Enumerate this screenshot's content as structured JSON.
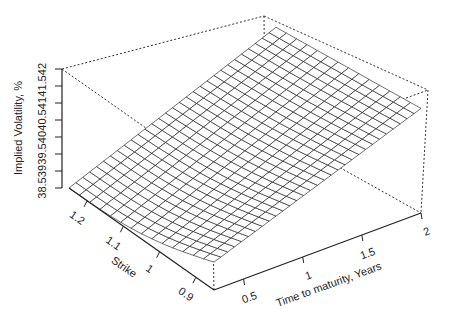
{
  "chart_data": {
    "type": "surface3d",
    "title": "",
    "xlabel": "Time to maturity, Years",
    "ylabel": "Strike",
    "zlabel": "Implied Volatility, %",
    "x_ticks": [
      "0.5",
      "1",
      "1.5",
      "2"
    ],
    "y_ticks": [
      "1.2",
      "1.1",
      "1",
      "0.9"
    ],
    "z_ticks": [
      "38.5",
      "39",
      "39.5",
      "40",
      "40.5",
      "41",
      "41.5",
      "42"
    ],
    "x_range": [
      0.25,
      2.0
    ],
    "y_range": [
      0.85,
      1.25
    ],
    "z_range": [
      38.5,
      42.0
    ],
    "grid": false,
    "legend": "none",
    "surface_style": "wireframe mesh, black",
    "surface_corners": [
      {
        "time": 0.25,
        "strike": 1.25,
        "vol": 38.5
      },
      {
        "time": 0.25,
        "strike": 0.85,
        "vol": 39.3
      },
      {
        "time": 2.0,
        "strike": 0.85,
        "vol": 41.5
      },
      {
        "time": 2.0,
        "strike": 1.25,
        "vol": 40.9
      }
    ]
  },
  "axes": {
    "z": {
      "label": "Implied Volatility, %",
      "ticks": [
        "38.5",
        "39",
        "39.5",
        "40",
        "40.5",
        "41",
        "41.5",
        "42"
      ]
    },
    "strike": {
      "label": "Strike",
      "ticks": [
        "1.2",
        "1.1",
        "1",
        "0.9"
      ]
    },
    "time": {
      "label": "Time to maturity, Years",
      "ticks": [
        "0.5",
        "1",
        "1.5",
        "2"
      ]
    }
  }
}
